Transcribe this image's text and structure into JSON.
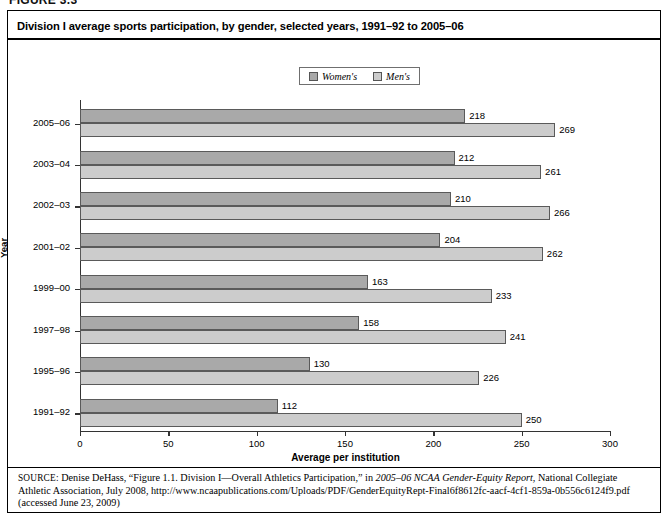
{
  "figure_label": "FIGURE 3.3",
  "chart_title": "Division I average sports participation, by gender, selected years, 1991–92 to 2005–06",
  "legend": {
    "items": [
      {
        "label": "Women's",
        "color": "#a9a9a9",
        "icon": "legend-swatch-icon"
      },
      {
        "label": "Men's",
        "color": "#cccccc",
        "icon": "legend-swatch-icon"
      }
    ]
  },
  "source": {
    "label": "SOURCE:",
    "text_1": " Denise DeHass, “Figure 1.1. Division I—Overall Athletics Participation,” in ",
    "italic_1": "2005–06 NCAA Gender-Equity Report",
    "text_2": ", National Collegiate Athletic Association, July 2008, http://www.ncaapublications.com/Uploads/PDF/GenderEquityRept-Final6f8612fc-aacf-4cf1-859a-0b556c6124f9.pdf (accessed June 23, 2009)"
  },
  "chart_data": {
    "type": "bar",
    "orientation": "horizontal",
    "title": "Division I average sports participation, by gender, selected years, 1991–92 to 2005–06",
    "xlabel": "Average per institution",
    "ylabel": "Year",
    "xlim": [
      0,
      300
    ],
    "xticks": [
      0,
      50,
      100,
      150,
      200,
      250,
      300
    ],
    "grid": false,
    "legend_position": "top-center",
    "categories": [
      "2005–06",
      "2003–04",
      "2002–03",
      "2001–02",
      "1999–00",
      "1997–98",
      "1995–96",
      "1991–92"
    ],
    "series": [
      {
        "name": "Women's",
        "color": "#a9a9a9",
        "values": [
          218,
          212,
          210,
          204,
          163,
          158,
          130,
          112
        ]
      },
      {
        "name": "Men's",
        "color": "#cccccc",
        "values": [
          269,
          261,
          266,
          262,
          233,
          241,
          226,
          250
        ]
      }
    ]
  }
}
